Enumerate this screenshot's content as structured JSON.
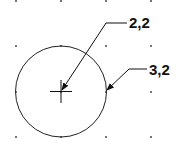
{
  "diagram": {
    "grid": {
      "xs": [
        16,
        61,
        106,
        151
      ],
      "ys": [
        0,
        46,
        92,
        137
      ],
      "dot_color": "#333333"
    },
    "circle": {
      "cx": 61,
      "cy": 91.5,
      "r": 45.5,
      "stroke": "#222222"
    },
    "center_mark": {
      "x": 61,
      "y": 91.5,
      "size": 11
    },
    "callouts": [
      {
        "label": "2,2",
        "target": "center point"
      },
      {
        "label": "3,2",
        "target": "point on circle"
      }
    ]
  }
}
